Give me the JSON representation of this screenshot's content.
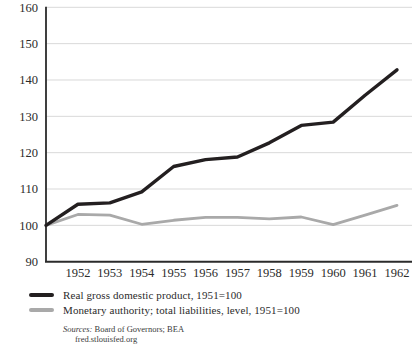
{
  "chart_data": {
    "type": "line",
    "x": [
      1951,
      1952,
      1953,
      1954,
      1955,
      1956,
      1957,
      1958,
      1959,
      1960,
      1961,
      1962
    ],
    "x_tick_labels": [
      "1952",
      "1953",
      "1954",
      "1955",
      "1956",
      "1957",
      "1958",
      "1959",
      "1960",
      "1961",
      "1962"
    ],
    "series": [
      {
        "name": "Real gross domestic product, 1951=100",
        "color": "#231f20",
        "stroke_width": 3.4,
        "values": [
          100,
          105.8,
          106.2,
          109.2,
          116.2,
          118.1,
          118.8,
          122.7,
          127.5,
          128.4,
          135.8,
          142.8
        ]
      },
      {
        "name": "Monetary authority; total liabilities, level, 1951=100",
        "color": "#a9a9a9",
        "stroke_width": 2.8,
        "values": [
          100,
          103.0,
          102.8,
          100.3,
          101.4,
          102.2,
          102.2,
          101.8,
          102.3,
          100.2,
          102.8,
          105.5
        ]
      }
    ],
    "title": "",
    "xlabel": "",
    "ylabel": "",
    "ylim": [
      90,
      160
    ],
    "yticks": [
      90,
      100,
      110,
      120,
      130,
      140,
      150,
      160
    ],
    "grid": "horizontal",
    "legend_position": "below-left"
  },
  "sources": {
    "label": "Sources:",
    "line1": "Board of Governors; BEA",
    "line2": "fred.stlouisfed.org"
  },
  "colors": {
    "gridline": "#d9d9d9",
    "axis": "#2b2b2b",
    "tick_text": "#2b2b2b",
    "background": "#ffffff"
  }
}
